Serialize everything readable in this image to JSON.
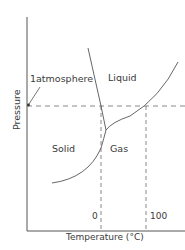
{
  "diagram": {
    "type": "phase-diagram",
    "regions": {
      "liquid": "Liquid",
      "solid": "Solid",
      "gas": "Gas"
    },
    "annotation": "1atmosphere",
    "x_ticks": [
      "0",
      "100"
    ],
    "xlabel": "Temperature (°C)",
    "ylabel": "Pressure",
    "colors": {
      "line": "#555555",
      "dashed": "#6a6a6a",
      "text": "#3a3a3a"
    }
  }
}
